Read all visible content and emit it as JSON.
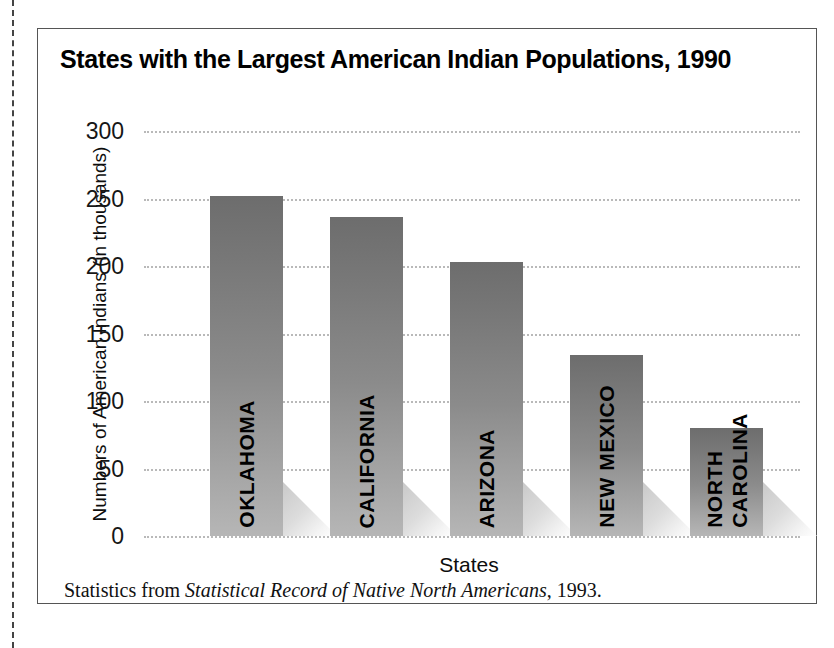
{
  "figure": {
    "title": "States with the Largest American Indian Populations, 1990",
    "source_prefix": "Statistics from ",
    "source_title": "Statistical Record of Native North Americans",
    "source_suffix": ", 1993."
  },
  "chart_data": {
    "type": "bar",
    "title": "States with the Largest American Indian Populations, 1990",
    "xlabel": "States",
    "ylabel": "Numbers of American Indians (in thousands)",
    "categories": [
      "OKLAHOMA",
      "CALIFORNIA",
      "ARIZONA",
      "NEW MEXICO",
      "NORTH CAROLINA"
    ],
    "category_lines": [
      [
        "OKLAHOMA"
      ],
      [
        "CALIFORNIA"
      ],
      [
        "ARIZONA"
      ],
      [
        "NEW MEXICO"
      ],
      [
        "NORTH",
        "CAROLINA"
      ]
    ],
    "values": [
      252,
      236,
      203,
      134,
      80
    ],
    "ylim": [
      0,
      300
    ],
    "yticks": [
      0,
      50,
      100,
      150,
      200,
      250,
      300
    ],
    "ytick_labels": [
      "0",
      "50",
      "100",
      "150",
      "200",
      "250",
      "300"
    ],
    "grid": true,
    "grid_style": "dotted-horizontal",
    "legend": "none",
    "bar_fill": "#8b8b8b",
    "bar_gradient_top": "#6d6d6d",
    "bar_gradient_bottom": "#b6b6b6",
    "shadow_color": "#d8d8d8",
    "background": "#ffffff"
  }
}
